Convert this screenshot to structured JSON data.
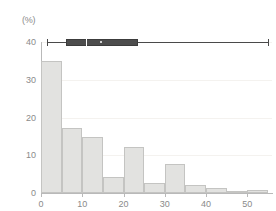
{
  "chart_data": {
    "type": "bar",
    "title": "",
    "subtitle": "",
    "xlabel": "",
    "ylabel": "",
    "unit_label": "(%)",
    "xlim": [
      0,
      56
    ],
    "ylim": [
      0,
      40
    ],
    "grid": true,
    "legend": "none",
    "bin_width": 5,
    "x_ticks": [
      "0",
      "10",
      "20",
      "30",
      "40",
      "50"
    ],
    "x_tick_values": [
      0,
      10,
      20,
      30,
      40,
      50
    ],
    "y_ticks": [
      "0",
      "10",
      "20",
      "30",
      "40"
    ],
    "y_tick_values": [
      0,
      10,
      20,
      30,
      40
    ],
    "categories": [
      "0-5",
      "5-10",
      "10-15",
      "15-20",
      "20-25",
      "25-30",
      "30-35",
      "35-40",
      "40-45",
      "45-50",
      "50-55"
    ],
    "bin_starts": [
      0,
      5,
      10,
      15,
      20,
      25,
      30,
      35,
      40,
      45,
      50
    ],
    "values": [
      35.0,
      17.3,
      14.8,
      4.2,
      12.1,
      2.6,
      7.8,
      2.2,
      1.2,
      0.2,
      0.9
    ],
    "bar_fill": "#e2e2e0",
    "bar_stroke": "#c4c4c2",
    "axis_color": "#b9b9b9",
    "grid_color": "#f4f2ef",
    "text_color": "#8a8a8a",
    "boxplot": {
      "position_y": 40,
      "whisker_low": 1.5,
      "q1": 6.0,
      "median": 11.0,
      "mean": 14.5,
      "q3": 23.5,
      "whisker_high": 55.0,
      "box_color": "#4d4d4d",
      "line_color": "#4a4a4a",
      "marker_color": "#ffffff"
    }
  }
}
